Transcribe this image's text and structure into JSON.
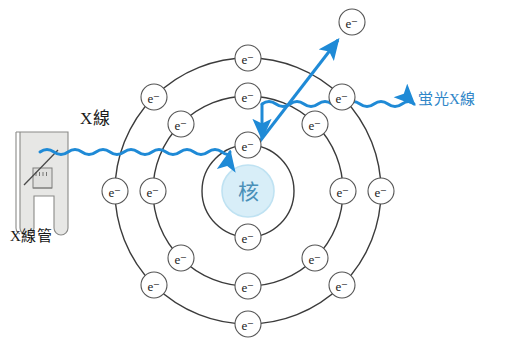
{
  "figure": {
    "background": "#ffffff"
  },
  "colors": {
    "ray_blue": "#1f8ad6",
    "label_blue": "#2f86c8",
    "shell_line": "#3b3b3b",
    "electron_stroke": "#555555",
    "electron_fill": "#ffffff",
    "nucleus_fill": "#d8eef8",
    "nucleus_stroke": "#bfe2f2",
    "nucleus_text": "#4a90b8",
    "tube_fill": "#e3e3e1",
    "tube_stroke": "#8a8a88",
    "text_black": "#1a1a1a"
  },
  "labels": {
    "incident_xray": "X線",
    "xray_tube": "X線管",
    "fluorescent_xray": "蛍光X線",
    "nucleus": "核",
    "electron": "e⁻"
  },
  "atom": {
    "center": {
      "x": 248,
      "y": 191
    },
    "nucleus_radius": 26,
    "shells": [
      {
        "name": "inner-shell",
        "radius": 46,
        "electron_count": 2,
        "electrons": [
          {
            "x": 248,
            "y": 145
          },
          {
            "x": 248,
            "y": 237
          }
        ]
      },
      {
        "name": "middle-shell",
        "radius": 95,
        "electron_count": 8,
        "electrons": [
          {
            "x": 248,
            "y": 96
          },
          {
            "x": 315,
            "y": 124
          },
          {
            "x": 343,
            "y": 191
          },
          {
            "x": 315,
            "y": 258
          },
          {
            "x": 248,
            "y": 286
          },
          {
            "x": 181,
            "y": 258
          },
          {
            "x": 153,
            "y": 191
          },
          {
            "x": 181,
            "y": 124
          }
        ]
      },
      {
        "name": "outer-shell",
        "radius": 133,
        "electron_count": 8,
        "electrons": [
          {
            "x": 248,
            "y": 58
          },
          {
            "x": 342,
            "y": 97
          },
          {
            "x": 381,
            "y": 191
          },
          {
            "x": 342,
            "y": 285
          },
          {
            "x": 248,
            "y": 324
          },
          {
            "x": 154,
            "y": 285
          },
          {
            "x": 115,
            "y": 191
          },
          {
            "x": 154,
            "y": 97
          }
        ]
      }
    ],
    "ejected_electron": {
      "x": 352,
      "y": 22
    }
  },
  "rays": {
    "incident": {
      "name": "incident-xray-wave",
      "from": {
        "x": 40,
        "y": 151
      },
      "to": {
        "x": 240,
        "y": 147
      },
      "style": "wavy-arrow",
      "color": "#1f8ad6"
    },
    "fluorescent": {
      "name": "fluorescent-xray-wave",
      "from": {
        "x": 262,
        "y": 104
      },
      "to": {
        "x": 412,
        "y": 101
      },
      "style": "wavy-arrow",
      "color": "#1f8ad6"
    },
    "photoelectron": {
      "name": "ejected-electron-arrow",
      "from": {
        "x": 252,
        "y": 152
      },
      "to": {
        "x": 340,
        "y": 38
      },
      "style": "straight-arrow",
      "color": "#1f8ad6"
    },
    "transition": {
      "name": "electron-transition-arrow",
      "from": {
        "x": 262,
        "y": 104
      },
      "to": {
        "x": 262,
        "y": 140
      },
      "style": "straight-arrow",
      "color": "#1f8ad6"
    }
  },
  "xray_tube": {
    "name": "x-ray-tube",
    "body": {
      "x": 16,
      "y": 132,
      "width": 52,
      "height": 62
    },
    "legs": [
      {
        "x": 20,
        "y": 194,
        "width": 14,
        "height": 34
      },
      {
        "x": 50,
        "y": 194,
        "width": 14,
        "height": 34
      }
    ],
    "filament": {
      "x": 33,
      "y": 168,
      "width": 18,
      "height": 20
    },
    "anode_line": {
      "from": {
        "x": 24,
        "y": 183
      },
      "to": {
        "x": 58,
        "y": 152
      }
    }
  }
}
